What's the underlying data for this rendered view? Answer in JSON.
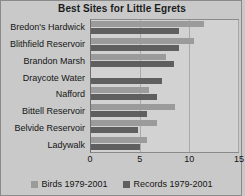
{
  "chart_data": {
    "type": "bar",
    "orientation": "horizontal",
    "title": "Best Sites for Little Egrets",
    "xlabel": "",
    "ylabel": "",
    "xlim": [
      0,
      15
    ],
    "xticks": [
      0,
      5,
      10,
      15
    ],
    "grid": true,
    "legend_position": "bottom",
    "categories": [
      "Bredon's Hardwick",
      "Blithfield Reservoir",
      "Brandon Marsh",
      "Draycote Water",
      "Nafford",
      "Bittell Reservoir",
      "Belvide Reservoir",
      "Ladywalk"
    ],
    "series": [
      {
        "name": "Birds 1979-2001",
        "color": "#9b9b9b",
        "values": [
          11.5,
          10.5,
          7.7,
          0,
          5.9,
          8.6,
          6.7,
          5.7
        ]
      },
      {
        "name": "Records 1979-2001",
        "color": "#5f5f5f",
        "values": [
          9.0,
          9.0,
          8.5,
          7.2,
          6.7,
          5.7,
          4.8,
          5.0
        ]
      }
    ]
  },
  "colors": {
    "background": "#c9c9c9",
    "plot_background": "#d2d2d2",
    "birds": "#9b9b9b",
    "records": "#5f5f5f",
    "axis": "#8a8a8a"
  }
}
